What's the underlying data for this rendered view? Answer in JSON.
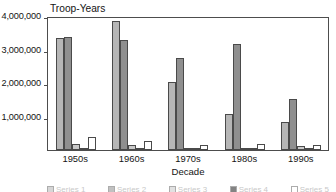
{
  "chart_data": {
    "type": "bar",
    "title": "Troop-Years",
    "xlabel": "Decade",
    "ylabel": "",
    "ylim": [
      0,
      4000000
    ],
    "ytick_labels": [
      "1,000,000",
      "2,000,000",
      "3,000,000",
      "4,000,000"
    ],
    "ytick_values": [
      1000000,
      2000000,
      3000000,
      4000000
    ],
    "grid": false,
    "legend_position": "bottom",
    "categories": [
      "1950s",
      "1960s",
      "1970s",
      "1980s",
      "1990s"
    ],
    "series": [
      {
        "name": "Series 1",
        "color": "#b6b6b6",
        "values": [
          3330000,
          3850000,
          2030000,
          1070000,
          850000
        ]
      },
      {
        "name": "Series 2",
        "color": "#8f8f8f",
        "values": [
          3370000,
          3280000,
          2740000,
          3160000,
          1530000
        ]
      },
      {
        "name": "Series 3",
        "color": "#c9c9c9",
        "values": [
          190000,
          140000,
          70000,
          60000,
          130000
        ]
      },
      {
        "name": "Series 4",
        "color": "#1e1e1e",
        "values": [
          60000,
          55000,
          25000,
          15000,
          20000
        ]
      },
      {
        "name": "Series 5",
        "color": "#ffffff",
        "values": [
          400000,
          280000,
          150000,
          170000,
          150000
        ]
      }
    ]
  },
  "axis": {
    "y_title": "Troop-Years",
    "x_title": "Decade"
  }
}
